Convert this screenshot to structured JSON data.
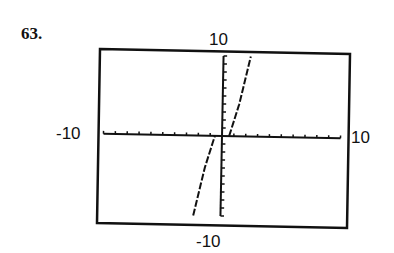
{
  "problem": {
    "number": "63."
  },
  "window": {
    "xmin_label": "-10",
    "xmax_label": "10",
    "ymin_label": "-10",
    "ymax_label": "10"
  },
  "colors": {
    "ink": "#111111",
    "background": "#ffffff"
  },
  "chart_data": {
    "type": "line",
    "title": "",
    "xlabel": "",
    "ylabel": "",
    "xlim": [
      -10,
      10
    ],
    "ylim": [
      -10,
      10
    ],
    "grid": false,
    "x_ticks_step": 1,
    "y_ticks_step": 1,
    "legend": null,
    "style": "graphing-calculator screen, dashed/stepped curve, increasing odd-symmetric function (cubic-like)",
    "series": [
      {
        "name": "curve",
        "x": [
          -2.3,
          -2.0,
          -1.7,
          -1.4,
          -1.1,
          -0.8,
          -0.6,
          0.6,
          0.8,
          1.1,
          1.4,
          1.7,
          2.0,
          2.3
        ],
        "y": [
          -10,
          -8,
          -6,
          -4,
          -2.5,
          -1.0,
          0,
          0,
          1.0,
          2.5,
          4,
          6,
          8,
          10
        ]
      }
    ]
  }
}
